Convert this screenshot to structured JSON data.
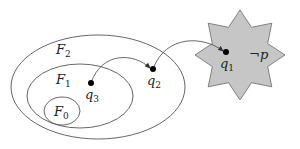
{
  "diagram": {
    "colors": {
      "stroke": "#555555",
      "star_fill": "#c6c6c6",
      "star_stroke": "#6a6a6a",
      "dot": "#000000",
      "text": "#222222"
    },
    "regions": [
      {
        "id": "F2",
        "base": "F",
        "subscript": "2",
        "shape": "ellipse",
        "cx": 98,
        "cy": 87,
        "rx": 87,
        "ry": 52,
        "label_x": 56,
        "label_y": 54
      },
      {
        "id": "F1",
        "base": "F",
        "subscript": "1",
        "shape": "ellipse",
        "cx": 80,
        "cy": 96,
        "rx": 53,
        "ry": 32,
        "label_x": 56,
        "label_y": 84
      },
      {
        "id": "F0",
        "base": "F",
        "subscript": "0",
        "shape": "ellipse",
        "cx": 62,
        "cy": 111,
        "rx": 18,
        "ry": 14,
        "label_x": 54,
        "label_y": 116
      }
    ],
    "goal_region": {
      "shape": "8-pointed-star",
      "cx": 240,
      "cy": 55,
      "outer_r": 45,
      "inner_r": 30,
      "label": "¬p",
      "label_x": 249,
      "label_y": 59
    },
    "states": [
      {
        "id": "q3",
        "base": "q",
        "subscript": "3",
        "x": 91,
        "y": 83,
        "label_x": 85,
        "label_y": 99
      },
      {
        "id": "q2",
        "base": "q",
        "subscript": "2",
        "x": 153,
        "y": 69,
        "label_x": 147,
        "label_y": 85
      },
      {
        "id": "q1",
        "base": "q",
        "subscript": "1",
        "x": 226,
        "y": 52,
        "label_x": 220,
        "label_y": 68
      }
    ],
    "transitions": [
      {
        "from": "q3",
        "to": "q2"
      },
      {
        "from": "q2",
        "to": "q1"
      }
    ]
  }
}
